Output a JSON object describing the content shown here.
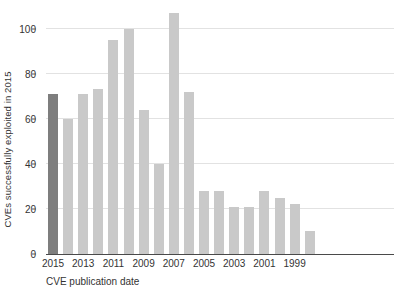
{
  "chart_data": {
    "type": "bar",
    "title": "",
    "xlabel": "CVE publication date",
    "ylabel": "CVEs successfully exploited in 2015",
    "ylim": [
      0,
      110
    ],
    "yticks": [
      0,
      20,
      40,
      60,
      80,
      100
    ],
    "grid": true,
    "legend": "none",
    "x_tick_labels": [
      "2015",
      "2013",
      "2011",
      "2009",
      "2007",
      "2005",
      "2003",
      "2001",
      "1999"
    ],
    "categories": [
      "2015",
      "2014",
      "2013",
      "2012",
      "2011",
      "2010",
      "2009",
      "2008",
      "2007",
      "2006",
      "2005",
      "2004",
      "2003",
      "2002",
      "2001",
      "2000",
      "1999",
      "1998"
    ],
    "values": [
      71,
      60,
      71,
      73,
      95,
      100,
      64,
      40,
      107,
      72,
      28,
      28,
      21,
      21,
      28,
      25,
      22,
      10
    ],
    "highlight_category": "2015",
    "colors": {
      "bar": "#c9c9c9",
      "highlight_bar": "#7e7e7e",
      "grid": "#e2e2e2",
      "axis": "#4a4a4a",
      "text": "#333333",
      "background": "#ffffff"
    }
  }
}
